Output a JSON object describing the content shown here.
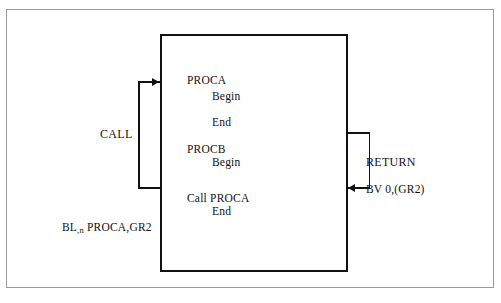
{
  "figure": {
    "kind": "procedure-call-return-diagram",
    "background_color": "#ffffff",
    "ink_color": "#121212",
    "frame_color": "#9a9a9a"
  },
  "program_box": {
    "code_lines": [
      {
        "text": "PROCA",
        "x": 187,
        "y": 74,
        "indent": "none"
      },
      {
        "text": "Begin",
        "x": 212,
        "y": 90,
        "indent": "one"
      },
      {
        "text": "End",
        "x": 212,
        "y": 116,
        "indent": "one"
      },
      {
        "text": "PROCB",
        "x": 187,
        "y": 143,
        "indent": "none"
      },
      {
        "text": "Begin",
        "x": 212,
        "y": 156,
        "indent": "one"
      },
      {
        "text": "Call PROCA",
        "x": 187,
        "y": 192,
        "indent": "none"
      },
      {
        "text": "End",
        "x": 212,
        "y": 205,
        "indent": "one"
      }
    ]
  },
  "call_side": {
    "label": "CALL",
    "instruction_prefix": "BL",
    "instruction_subscript": ",n",
    "instruction_suffix": " PROCA,GR2",
    "instruction_full": "BL,n PROCA,GR2",
    "arrow_direction": "right-into-box"
  },
  "return_side": {
    "label": "RETURN",
    "instruction": "BV 0,(GR2)",
    "arrow_direction": "left-into-box"
  }
}
